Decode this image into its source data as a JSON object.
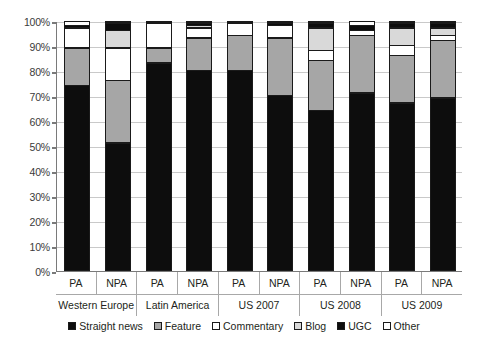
{
  "chart_data": {
    "type": "bar",
    "subtype": "stacked-100-percent",
    "title": "",
    "xlabel": "",
    "ylabel": "",
    "ylim": [
      0,
      100
    ],
    "grid": true,
    "legend_position": "bottom",
    "categories": [
      "PA",
      "NPA",
      "PA",
      "NPA",
      "PA",
      "NPA",
      "PA",
      "NPA",
      "PA",
      "NPA"
    ],
    "groups": [
      {
        "label": "Western Europe",
        "members": [
          "PA",
          "NPA"
        ]
      },
      {
        "label": "Latin America",
        "members": [
          "PA",
          "NPA"
        ]
      },
      {
        "label": "US 2007",
        "members": [
          "PA",
          "NPA"
        ]
      },
      {
        "label": "US 2008",
        "members": [
          "PA",
          "NPA"
        ]
      },
      {
        "label": "US 2009",
        "members": [
          "PA",
          "NPA"
        ]
      }
    ],
    "ytick_labels": [
      "100%",
      "90%",
      "80%",
      "70%",
      "60%",
      "50%",
      "40%",
      "30%",
      "20%",
      "10%",
      "0%"
    ],
    "ytick_values": [
      100,
      90,
      80,
      70,
      60,
      50,
      40,
      30,
      20,
      10,
      0
    ],
    "series": [
      {
        "name": "Straight news",
        "color": "#0d0d0d",
        "values": [
          74,
          51,
          83,
          80,
          80,
          70,
          64,
          71,
          67,
          69
        ]
      },
      {
        "name": "Feature",
        "color": "#a6a6a6",
        "values": [
          15,
          25,
          6,
          13,
          14,
          23,
          20,
          23,
          19,
          23
        ]
      },
      {
        "name": "Commentary",
        "color": "#ffffff",
        "values": [
          8,
          13,
          10,
          4,
          5,
          5,
          4,
          2,
          4,
          2
        ]
      },
      {
        "name": "Blog",
        "color": "#d9d9d9",
        "values": [
          0,
          7,
          0,
          1,
          0,
          0,
          9,
          0,
          7,
          3
        ]
      },
      {
        "name": "UGC",
        "color": "#0d0d0d",
        "values": [
          1,
          3,
          1,
          1,
          1,
          1,
          2,
          2,
          2,
          2
        ]
      },
      {
        "name": "Other",
        "color": "#ffffff",
        "values": [
          2,
          1,
          0,
          1,
          0,
          1,
          1,
          2,
          1,
          1
        ]
      }
    ]
  },
  "legend": {
    "items": [
      {
        "label": "Straight news",
        "swatch": "swatch-straight-news"
      },
      {
        "label": "Feature",
        "swatch": "swatch-feature"
      },
      {
        "label": "Commentary",
        "swatch": "swatch-commentary"
      },
      {
        "label": "Blog",
        "swatch": "swatch-blog"
      },
      {
        "label": "UGC",
        "swatch": "swatch-ugc"
      },
      {
        "label": "Other",
        "swatch": "swatch-other"
      }
    ]
  }
}
